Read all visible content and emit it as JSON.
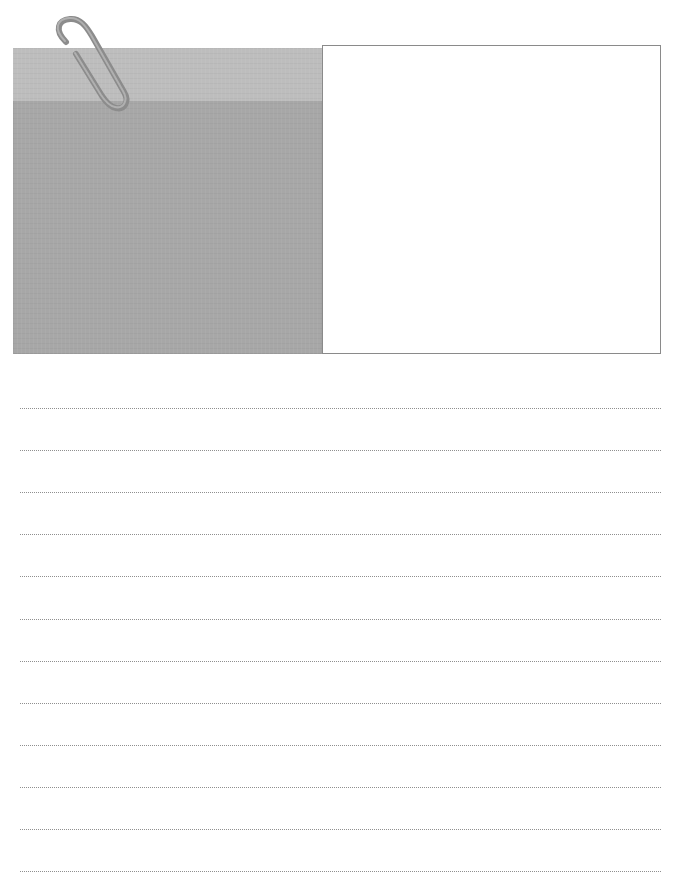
{
  "page": {
    "type": "blank note sheet",
    "memo_block": {
      "icon": "paperclip-icon",
      "header_color": "#bdbdbd",
      "body_color": "#a7a7a7"
    },
    "photo_frame": {
      "border_color": "#8a8a8a",
      "fill": "#ffffff"
    },
    "writing_lines": {
      "count": 12,
      "style": "dotted",
      "color": "#8f8f8f",
      "y_positions": [
        408,
        450,
        492,
        534,
        576,
        619,
        661,
        703,
        745,
        787,
        829,
        871
      ]
    }
  }
}
